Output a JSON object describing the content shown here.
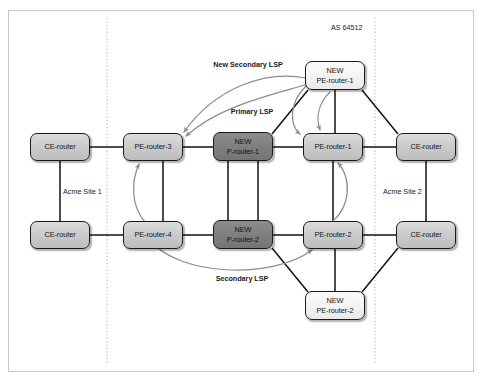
{
  "figure": {
    "as_label": "AS 64512",
    "site_left_label": "Acme Site 1",
    "site_right_label": "Acme Site 2",
    "colors": {
      "frame_border": "#c8c8c8",
      "node_border": "#1a1a1a",
      "node_light_fill": "#c9c9c9",
      "node_dark_fill": "#7e7e7e",
      "node_white_fill": "#f2f2f2",
      "link_line": "#111111",
      "lsp_arrow": "#8c8c8c",
      "boundary_dotted": "#bbbbbb",
      "text": "#1a1a1a",
      "background": "#ffffff"
    }
  },
  "nodes": [
    {
      "id": "ce-left-top",
      "line1": "CE-router",
      "line2": "",
      "style": "light",
      "x": 30,
      "y": 133,
      "w": 60,
      "h": 28
    },
    {
      "id": "ce-left-bottom",
      "line1": "CE-router",
      "line2": "",
      "style": "light",
      "x": 30,
      "y": 221,
      "w": 60,
      "h": 28
    },
    {
      "id": "pe-router-3",
      "line1": "PE-router-3",
      "line2": "",
      "style": "light",
      "x": 123,
      "y": 133,
      "w": 60,
      "h": 28
    },
    {
      "id": "pe-router-4",
      "line1": "PE-router-4",
      "line2": "",
      "style": "light",
      "x": 123,
      "y": 221,
      "w": 60,
      "h": 28
    },
    {
      "id": "new-p-router-1",
      "line1": "NEW",
      "line2": "P-router-1",
      "style": "dark",
      "x": 213,
      "y": 132,
      "w": 60,
      "h": 29
    },
    {
      "id": "new-p-router-2",
      "line1": "NEW",
      "line2": "P-router-2",
      "style": "dark",
      "x": 213,
      "y": 220,
      "w": 60,
      "h": 29
    },
    {
      "id": "pe-router-1",
      "line1": "PE-router-1",
      "line2": "",
      "style": "light",
      "x": 303,
      "y": 133,
      "w": 60,
      "h": 28
    },
    {
      "id": "pe-router-2",
      "line1": "PE-router-2",
      "line2": "",
      "style": "light",
      "x": 303,
      "y": 221,
      "w": 60,
      "h": 28
    },
    {
      "id": "new-pe-router-1",
      "line1": "NEW",
      "line2": "PE-router-1",
      "style": "white",
      "x": 305,
      "y": 61,
      "w": 60,
      "h": 29
    },
    {
      "id": "new-pe-router-2",
      "line1": "NEW",
      "line2": "PE-router-2",
      "style": "white",
      "x": 305,
      "y": 291,
      "w": 60,
      "h": 29
    },
    {
      "id": "ce-right-top",
      "line1": "CE-router",
      "line2": "",
      "style": "light",
      "x": 396,
      "y": 133,
      "w": 60,
      "h": 28
    },
    {
      "id": "ce-right-bottom",
      "line1": "CE-router",
      "line2": "",
      "style": "light",
      "x": 396,
      "y": 221,
      "w": 60,
      "h": 28
    }
  ],
  "annotations": [
    {
      "id": "new-secondary-lsp",
      "line1": "New",
      "line2": "Secondary LSP",
      "x": 247,
      "y": 66,
      "align": "center"
    },
    {
      "id": "primary-lsp",
      "line1": "Primary LSP",
      "line2": "",
      "x": 252,
      "y": 113,
      "align": "center"
    },
    {
      "id": "secondary-lsp",
      "line1": "Secondary LSP",
      "line2": "",
      "x": 242,
      "y": 280,
      "align": "center"
    }
  ],
  "boundaries": [
    {
      "id": "site-1-boundary",
      "x": 107,
      "y1": 18,
      "y2": 365
    },
    {
      "id": "site-2-boundary",
      "x": 375,
      "y1": 18,
      "y2": 365
    }
  ],
  "links": [
    {
      "from": "ce-left-top",
      "to": "pe-router-3",
      "kind": "access"
    },
    {
      "from": "ce-left-bottom",
      "to": "pe-router-4",
      "kind": "access"
    },
    {
      "from": "ce-left-top",
      "to": "ce-left-bottom",
      "kind": "site"
    },
    {
      "from": "pe-router-3",
      "to": "pe-router-4",
      "kind": "core"
    },
    {
      "from": "pe-router-3",
      "to": "new-p-router-1",
      "kind": "core"
    },
    {
      "from": "new-p-router-1",
      "to": "new-p-router-2",
      "kind": "core"
    },
    {
      "from": "new-p-router-1",
      "to": "pe-router-1",
      "kind": "core"
    },
    {
      "from": "new-p-router-1",
      "to": "new-pe-router-1",
      "kind": "core"
    },
    {
      "from": "pe-router-4",
      "to": "new-p-router-2",
      "kind": "core"
    },
    {
      "from": "new-p-router-2",
      "to": "pe-router-2",
      "kind": "core"
    },
    {
      "from": "new-p-router-2",
      "to": "new-pe-router-2",
      "kind": "core"
    },
    {
      "from": "pe-router-1",
      "to": "pe-router-2",
      "kind": "core"
    },
    {
      "from": "pe-router-1",
      "to": "new-pe-router-1",
      "kind": "core"
    },
    {
      "from": "pe-router-2",
      "to": "new-pe-router-2",
      "kind": "core"
    },
    {
      "from": "pe-router-1",
      "to": "ce-right-top",
      "kind": "access"
    },
    {
      "from": "pe-router-2",
      "to": "ce-right-bottom",
      "kind": "access"
    },
    {
      "from": "new-pe-router-1",
      "to": "ce-right-top",
      "kind": "access"
    },
    {
      "from": "new-pe-router-2",
      "to": "ce-right-bottom",
      "kind": "access"
    },
    {
      "from": "ce-right-top",
      "to": "ce-right-bottom",
      "kind": "site"
    }
  ],
  "lsp_paths": [
    {
      "id": "primary-lsp-arrow",
      "label": "Primary LSP",
      "from": "new-pe-router-1",
      "to": "pe-router-3"
    },
    {
      "id": "new-secondary-lsp-arrow",
      "label": "New Secondary LSP",
      "from": "new-pe-router-1",
      "to": "pe-router-3"
    },
    {
      "id": "primary-lsp-arrow-right",
      "label": "Primary LSP",
      "from": "new-pe-router-1",
      "to": "pe-router-1"
    },
    {
      "id": "down-arrow",
      "label": "",
      "from": "new-pe-router-1",
      "to": "pe-router-1"
    },
    {
      "id": "secondary-lsp-arrow-left",
      "label": "Secondary LSP",
      "from": "pe-router-4",
      "to": "pe-router-3"
    },
    {
      "id": "secondary-lsp-arrow-mid",
      "label": "Secondary LSP",
      "from": "pe-router-4",
      "to": "pe-router-2"
    },
    {
      "id": "secondary-lsp-arrow-up",
      "label": "Secondary LSP",
      "from": "pe-router-2",
      "to": "pe-router-1"
    }
  ]
}
